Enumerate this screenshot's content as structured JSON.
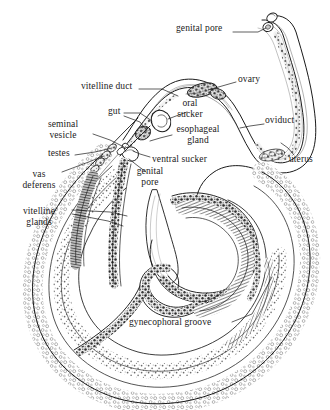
{
  "figure": {
    "background_color": "#ffffff",
    "ink_color": "#1a1a1a",
    "width": 330,
    "height": 410
  },
  "labels": [
    {
      "id": "genital-pore-female",
      "text": "genital pore",
      "x": 176,
      "y": 28,
      "align": "left"
    },
    {
      "id": "vitelline-duct",
      "text": "vitelline duct",
      "x": 81,
      "y": 86,
      "align": "left"
    },
    {
      "id": "ovary",
      "text": "ovary",
      "x": 238,
      "y": 79,
      "align": "left"
    },
    {
      "id": "gut",
      "text": "gut",
      "x": 110,
      "y": 111,
      "align": "left"
    },
    {
      "id": "oral-sucker",
      "text": "oral\nsucker",
      "x": 190,
      "y": 103,
      "align": "center"
    },
    {
      "id": "oviduct",
      "text": "oviduct",
      "x": 265,
      "y": 120,
      "align": "left"
    },
    {
      "id": "seminal-vesicle",
      "text": "seminal\nvesicle",
      "x": 62,
      "y": 124,
      "align": "center"
    },
    {
      "id": "esophageal-gland",
      "text": "esophageal\ngland",
      "x": 198,
      "y": 129,
      "align": "center"
    },
    {
      "id": "testes",
      "text": "testes",
      "x": 49,
      "y": 153,
      "align": "left"
    },
    {
      "id": "ventral-sucker",
      "text": "ventral sucker",
      "x": 152,
      "y": 159,
      "align": "left"
    },
    {
      "id": "uterus",
      "text": "uterus",
      "x": 290,
      "y": 159,
      "align": "left"
    },
    {
      "id": "genital-pore-male",
      "text": "genital\npore",
      "x": 150,
      "y": 171,
      "align": "center"
    },
    {
      "id": "vas-deferens",
      "text": "vas\ndeferens",
      "x": 38,
      "y": 174,
      "align": "center"
    },
    {
      "id": "vitelline-glands",
      "text": "vitelline\nglands",
      "x": 38,
      "y": 211,
      "align": "center"
    },
    {
      "id": "gynecophoral-groove",
      "text": "gynecophoral groove",
      "x": 130,
      "y": 322,
      "align": "left"
    }
  ],
  "leaders": [
    {
      "id": "leader-genital-pore-female",
      "from_label": "genital pore",
      "points": "233,32 258,32 266,28"
    },
    {
      "id": "leader-vitelline-duct",
      "from_label": "vitelline duct",
      "points": "139,89 160,89 176,95"
    },
    {
      "id": "leader-ovary",
      "from_label": "ovary",
      "points": "237,82 224,86 210,90"
    },
    {
      "id": "leader-gut-a",
      "from_label": "gut",
      "points": "124,113 138,113 150,120"
    },
    {
      "id": "leader-gut-b",
      "from_label": "gut",
      "points": "124,115 138,120 146,130"
    },
    {
      "id": "leader-oral-sucker",
      "from_label": "oral sucker",
      "points": "188,112 176,116 166,119"
    },
    {
      "id": "leader-oviduct",
      "from_label": "oviduct",
      "points": "264,124 250,126 240,128"
    },
    {
      "id": "leader-seminal-vesicle",
      "from_label": "seminal vesicle",
      "points": "92,135 110,140 126,146"
    },
    {
      "id": "leader-esophageal-gland",
      "from_label": "esophageal gland",
      "points": "172,134 160,138 150,142"
    },
    {
      "id": "leader-testes",
      "from_label": "testes",
      "points": "75,155 95,152 112,149"
    },
    {
      "id": "leader-ventral-sucker",
      "from_label": "ventral sucker",
      "points": "150,158 140,154 132,150"
    },
    {
      "id": "leader-uterus",
      "from_label": "uterus",
      "points": "293,155 288,148 282,142"
    },
    {
      "id": "leader-genital-pore-male",
      "from_label": "genital pore",
      "points": "146,172 138,166 130,159"
    },
    {
      "id": "leader-vas-deferens",
      "from_label": "vas deferens",
      "points": "62,172 85,163 104,155"
    },
    {
      "id": "leader-vitelline-glands-a",
      "from_label": "vitelline glands",
      "points": "72,210 110,212 126,215"
    },
    {
      "id": "leader-vitelline-glands-b",
      "from_label": "vitelline glands",
      "points": "72,214 108,221 122,225"
    },
    {
      "id": "leader-gynecophoral-groove",
      "from_label": "gynecophoral groove",
      "points": "232,322 250,315 272,276"
    }
  ],
  "structures": {
    "female_worm": "slender filiform worm, anterior free, posterior held in male groove",
    "male_worm": "stout worm with incurved body forming gynecophoral canal",
    "stipple_texture": "fine dotted shading on male tegument",
    "granular_texture": "dark granular shading on vitelline glands and gut"
  }
}
